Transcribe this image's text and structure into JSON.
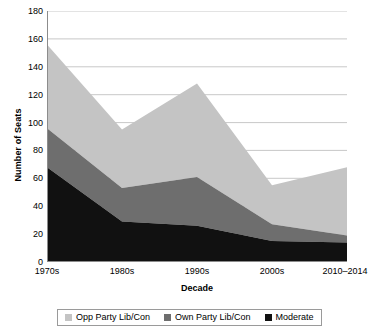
{
  "chart_data": {
    "type": "area",
    "stacked": true,
    "title": "",
    "xlabel": "Decade",
    "ylabel": "Number of Seats",
    "categories": [
      "1970s",
      "1980s",
      "1990s",
      "2000s",
      "2010–2014"
    ],
    "ylim": [
      0,
      180
    ],
    "y_ticks": [
      0,
      20,
      40,
      60,
      80,
      100,
      120,
      140,
      160,
      180
    ],
    "grid": "horizontal",
    "legend_position": "bottom",
    "series": [
      {
        "name": "Moderate",
        "color": "#111111",
        "values": [
          68,
          29,
          26,
          15,
          14
        ]
      },
      {
        "name": "Own Party Lib/Con",
        "color": "#6e6e6e",
        "values": [
          28,
          24,
          35,
          12,
          5
        ]
      },
      {
        "name": "Opp Party Lib/Con",
        "color": "#c4c4c4",
        "values": [
          60,
          42,
          67,
          28,
          49
        ]
      }
    ],
    "cumulative_totals": [
      156,
      95,
      128,
      55,
      68
    ]
  },
  "legend": {
    "items": [
      {
        "label": "Opp Party Lib/Con",
        "color": "#c4c4c4"
      },
      {
        "label": "Own Party Lib/Con",
        "color": "#6e6e6e"
      },
      {
        "label": "Moderate",
        "color": "#111111"
      }
    ]
  },
  "axes": {
    "y_title": "Number of Seats",
    "x_title": "Decade",
    "y_tick_labels": [
      "180",
      "160",
      "140",
      "120",
      "100",
      "80",
      "60",
      "40",
      "20",
      "0"
    ],
    "x_tick_labels": [
      "1970s",
      "1980s",
      "1990s",
      "2000s",
      "2010–2014"
    ]
  },
  "colors": {
    "axis": "#8c8c8c",
    "grid": "#c8c8c8",
    "text": "#000000",
    "plot_background": "#ffffff"
  }
}
